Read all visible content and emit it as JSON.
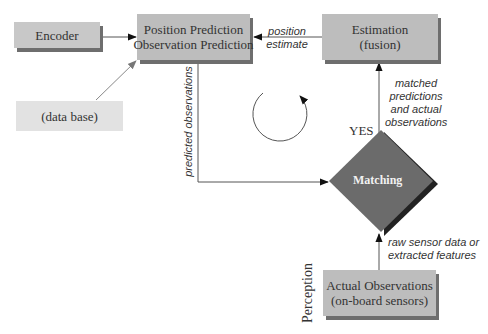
{
  "diagram": {
    "nodes": {
      "encoder": {
        "label": "Encoder"
      },
      "database": {
        "label": "(data base)"
      },
      "prediction": {
        "line1": "Position Prediction",
        "line2": "Observation Prediction"
      },
      "estimation": {
        "line1": "Estimation",
        "line2": "(fusion)"
      },
      "matching": {
        "label": "Matching"
      },
      "observations": {
        "line1": "Actual Observations",
        "line2": "(on-board sensors)"
      }
    },
    "edges": {
      "position_estimate": {
        "line1": "position",
        "line2": "estimate"
      },
      "predicted_observations": {
        "label": "predicted observations"
      },
      "matched": {
        "line1": "matched",
        "line2": "predictions",
        "line3": "and actual",
        "line4": "observations"
      },
      "raw_sensor": {
        "line1": "raw sensor data or",
        "line2": "extracted features"
      }
    },
    "decision_label": "YES",
    "side_label": "Perception",
    "colors": {
      "box_fill": "#bdbdbd",
      "box_shadow": "#6e6e6e",
      "database_fill": "#e2e2e2",
      "diamond_fill": "#6b6b6b",
      "diamond_shadow": "#222222",
      "line": "#555555"
    }
  }
}
